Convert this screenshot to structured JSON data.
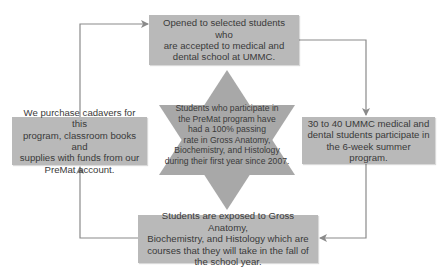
{
  "colors": {
    "box_fill": "#b9b9b9",
    "arrow": "#8a8a8a",
    "star_fill": "#a8a8a8",
    "text": "#3a3a3a"
  },
  "nodes": {
    "top": "Opened to selected students who\nare accepted to medical and\ndental school at UMMC.",
    "right": "30 to 40 UMMC medical and\ndental students participate in\nthe 6-week summer program.",
    "bottom": "Students are exposed to Gross Anatomy,\nBiochemistry, and Histology which are\ncourses that they will take in the fall of\nthe school year.",
    "left": "We purchase cadavers for this\nprogram, classroom books and\nsupplies with funds from our\nPreMat account.",
    "center": "Students who participate in\nthe PreMat program have\nhad a 100% passing\nrate in Gross Anatomy,\nBiochemistry, and Histology\nduring their first year since 2007."
  },
  "flow": [
    "top",
    "right",
    "bottom",
    "left",
    "top"
  ]
}
